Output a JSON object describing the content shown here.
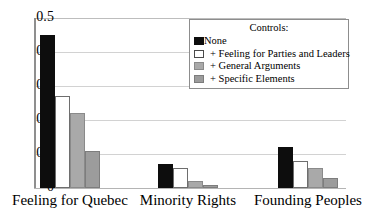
{
  "chart_data": {
    "type": "bar",
    "title": "",
    "xlabel": "",
    "ylabel": "",
    "ylim": [
      0,
      0.5
    ],
    "yticks": [
      "0",
      "0.1",
      "0.2",
      "0.3",
      "0.4",
      "0.5"
    ],
    "ytick_values": [
      0,
      0.1,
      0.2,
      0.3,
      0.4,
      0.5
    ],
    "grid": true,
    "legend_position": "top-right",
    "legend_title": "Controls:",
    "categories": [
      "Feeling for Quebec",
      "Minority Rights",
      "Founding Peoples"
    ],
    "series": [
      {
        "name": "None",
        "color": "#0d0d0d",
        "values": [
          0.45,
          0.07,
          0.12
        ]
      },
      {
        "name": "+ Feeling for Parties and Leaders",
        "color": "#ffffff",
        "values": [
          0.27,
          0.06,
          0.08
        ]
      },
      {
        "name": "+ General Arguments",
        "color": "#a9a9a9",
        "values": [
          0.22,
          0.02,
          0.06
        ]
      },
      {
        "name": "+ Specific Elements",
        "color": "#9c9c9c",
        "values": [
          0.11,
          0.01,
          0.03
        ]
      }
    ]
  },
  "yticks": [
    {
      "label": "0.5"
    },
    {
      "label": "0.4"
    },
    {
      "label": "0.3"
    },
    {
      "label": "0.2"
    },
    {
      "label": "0.1"
    },
    {
      "label": "0"
    }
  ],
  "legend": {
    "title": "Controls:",
    "items": [
      {
        "label": "None"
      },
      {
        "label": "+ Feeling for Parties and Leaders"
      },
      {
        "label": "+ General Arguments"
      },
      {
        "label": "+ Specific Elements"
      }
    ]
  },
  "xlabels": [
    {
      "label": "Feeling for Quebec"
    },
    {
      "label": "Minority Rights"
    },
    {
      "label": "Founding Peoples"
    }
  ]
}
